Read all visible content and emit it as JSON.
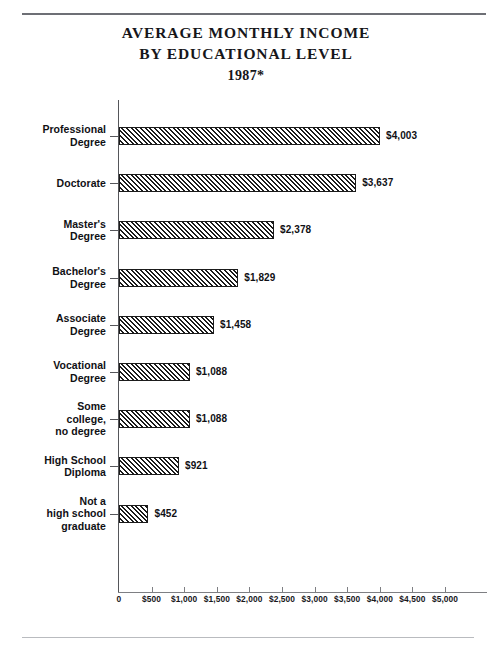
{
  "page": {
    "title_lines": [
      "AVERAGE MONTHLY INCOME",
      "BY EDUCATIONAL LEVEL"
    ],
    "title_line_1": "AVERAGE MONTHLY INCOME",
    "title_line_2": "BY EDUCATIONAL LEVEL",
    "year": "1987*"
  },
  "chart_data": {
    "type": "bar",
    "orientation": "horizontal",
    "title": "AVERAGE MONTHLY INCOME BY EDUCATIONAL LEVEL 1987*",
    "xlabel": "",
    "ylabel": "",
    "xlim": [
      0,
      5000
    ],
    "grid": false,
    "legend": null,
    "xticks": [
      0,
      500,
      1000,
      1500,
      2000,
      2500,
      3000,
      3500,
      4000,
      4500,
      5000
    ],
    "xticklabels": [
      "0",
      "$500",
      "$1,000",
      "$1,500",
      "$2,000",
      "$2,500",
      "$3,000",
      "$3,500",
      "$4,000",
      "$4,500",
      "$5,000"
    ],
    "categories": [
      "Professional Degree",
      "Doctorate",
      "Master's Degree",
      "Bachelor's Degree",
      "Associate Degree",
      "Vocational Degree",
      "Some college, no degree",
      "High School Diploma",
      "Not a high school graduate"
    ],
    "values": [
      4003,
      3637,
      2378,
      1829,
      1458,
      1088,
      1088,
      921,
      452
    ],
    "value_labels": [
      "$4,003",
      "$3,637",
      "$2,378",
      "$1,829",
      "$1,458",
      "$1,088",
      "$1,088",
      "$921",
      "$452"
    ],
    "bar_style": "diagonal-hatch",
    "bar_color": "#1b1b1b"
  },
  "bars": [
    {
      "label_lines": [
        "Professional",
        "Degree"
      ],
      "value": 4003,
      "value_label": "$4,003"
    },
    {
      "label_lines": [
        "Doctorate"
      ],
      "value": 3637,
      "value_label": "$3,637"
    },
    {
      "label_lines": [
        "Master's",
        "Degree"
      ],
      "value": 2378,
      "value_label": "$2,378"
    },
    {
      "label_lines": [
        "Bachelor's",
        "Degree"
      ],
      "value": 1829,
      "value_label": "$1,829"
    },
    {
      "label_lines": [
        "Associate",
        "Degree"
      ],
      "value": 1458,
      "value_label": "$1,458"
    },
    {
      "label_lines": [
        "Vocational",
        "Degree"
      ],
      "value": 1088,
      "value_label": "$1,088"
    },
    {
      "label_lines": [
        "Some",
        "college,",
        "no degree"
      ],
      "value": 1088,
      "value_label": "$1,088"
    },
    {
      "label_lines": [
        "High School",
        "Diploma"
      ],
      "value": 921,
      "value_label": "$921"
    },
    {
      "label_lines": [
        "Not a",
        "high school",
        "graduate"
      ],
      "value": 452,
      "value_label": "$452"
    }
  ]
}
